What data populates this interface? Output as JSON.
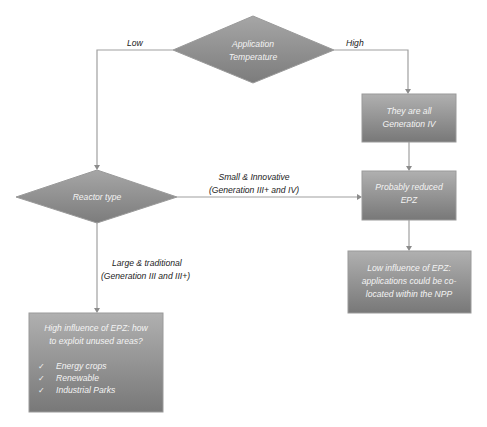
{
  "diagram": {
    "type": "flowchart",
    "colors": {
      "node_fill_top": "#b0b0b0",
      "node_fill_bottom": "#787878",
      "node_border": "#9a9a9a",
      "node_text": "#f4f4f4",
      "edge": "#a0a0a0",
      "label_text": "#222222"
    },
    "nodes": {
      "application_temperature": {
        "shape": "diamond",
        "lines": [
          "Application",
          "Temperature"
        ]
      },
      "reactor_type": {
        "shape": "diamond",
        "lines": [
          "Reactor type"
        ]
      },
      "generation_iv": {
        "shape": "box",
        "lines": [
          "They are all",
          "Generation IV"
        ]
      },
      "reduced_epz": {
        "shape": "box",
        "lines": [
          "Probably reduced",
          "EPZ"
        ]
      },
      "low_influence": {
        "shape": "box",
        "lines": [
          "Low influence of EPZ:",
          "applications could be co-",
          "located within the NPP"
        ]
      },
      "high_influence": {
        "shape": "box",
        "lines": [
          "High influence of EPZ: how",
          "to exploit unused areas?"
        ],
        "checklist": [
          "Energy crops",
          "Renewable",
          "Industrial Parks"
        ],
        "check_glyph": "✓"
      }
    },
    "edges": {
      "low": {
        "from": "application_temperature",
        "to": "reactor_type",
        "label": "Low"
      },
      "high": {
        "from": "application_temperature",
        "to": "generation_iv",
        "label": "High"
      },
      "small_innovative": {
        "from": "reactor_type",
        "to": "reduced_epz",
        "label_lines": [
          "Small & Innovative",
          "(Generation III+ and IV)"
        ]
      },
      "large_traditional": {
        "from": "reactor_type",
        "to": "high_influence",
        "label_lines": [
          "Large & traditional",
          "(Generation III and III+)"
        ]
      },
      "gen_iv_to_epz": {
        "from": "generation_iv",
        "to": "reduced_epz",
        "label": ""
      },
      "epz_to_low_influence": {
        "from": "reduced_epz",
        "to": "low_influence",
        "label": ""
      }
    }
  }
}
